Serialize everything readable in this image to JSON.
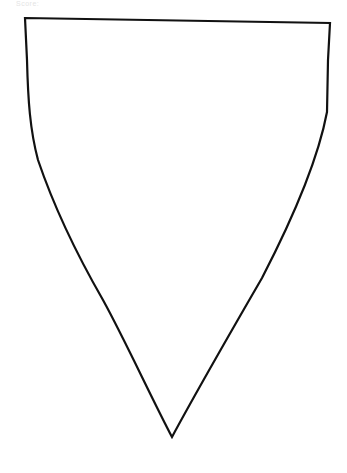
{
  "caption": {
    "text": "Score:"
  },
  "shape": {
    "name": "shield",
    "stroke_color": "#111111",
    "fill_color": "#ffffff",
    "stroke_width": 2.2,
    "path": "M 25 18 L 330 23 L 328 60 L 327 112 C 318 160, 292 220, 262 278 C 232 330, 200 385, 172 437 C 150 395, 125 340, 103 300 C 80 260, 55 210, 38 160 C 30 130, 28 100, 27 60 Z"
  }
}
